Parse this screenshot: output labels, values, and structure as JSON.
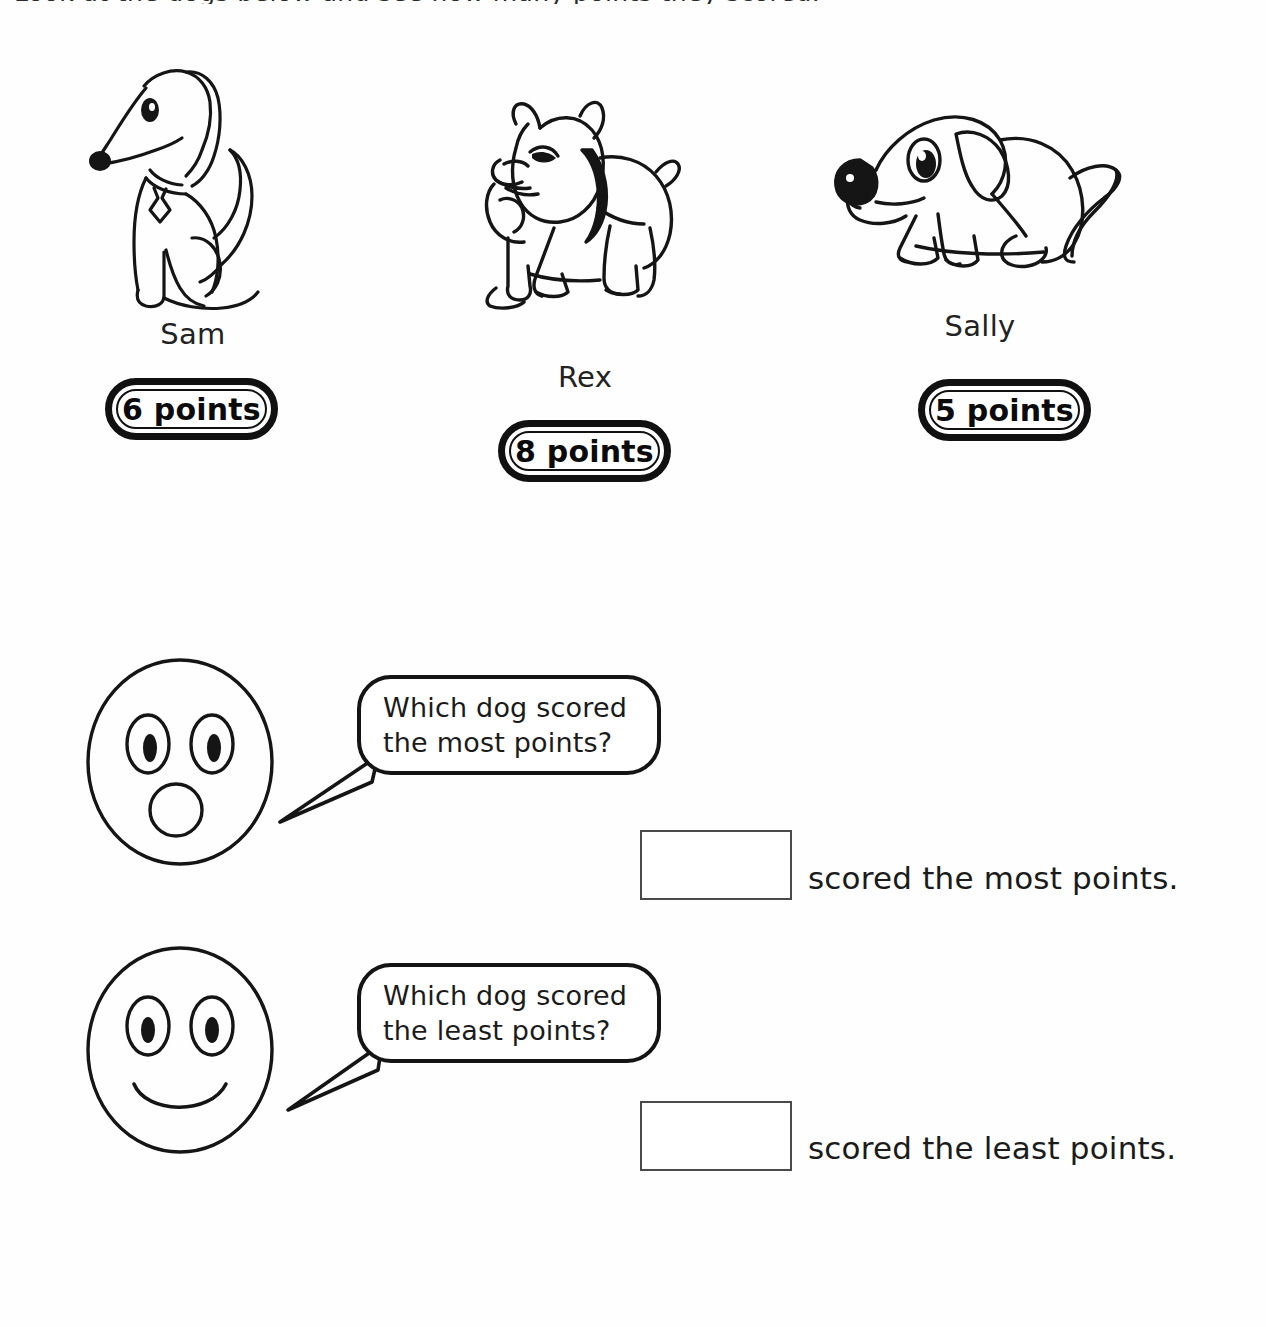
{
  "page": {
    "title": "Which dog scored the most points?",
    "top_cut_text": "Look at the dogs below and see how many points they scored.",
    "ink_color": "#141414",
    "paper_color": "#ffffff"
  },
  "dogs": [
    {
      "name": "Sam",
      "points_label": "6 points",
      "points": 6,
      "art": "sitting-long-nosed-dog"
    },
    {
      "name": "Rex",
      "points_label": "8 points",
      "points": 8,
      "art": "standing-bulldog"
    },
    {
      "name": "Sally",
      "points_label": "5 points",
      "points": 5,
      "art": "sitting-puppy"
    }
  ],
  "questions": [
    {
      "face": "surprised-face",
      "bubble_text": "Which dog scored\nthe most points?",
      "answer_prefix_placeholder": "",
      "answer_suffix": "scored the most points."
    },
    {
      "face": "smiling-face",
      "bubble_text": "Which dog scored\nthe least points?",
      "answer_prefix_placeholder": "",
      "answer_suffix": "scored the least points."
    }
  ]
}
